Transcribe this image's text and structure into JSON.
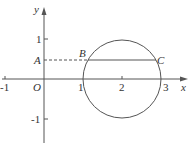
{
  "labels": {
    "y_axis": "y",
    "x_axis": "x",
    "origin": "O",
    "point_a": "A",
    "point_b": "B",
    "point_c": "C",
    "x_ticks": [
      "-1",
      "1",
      "2",
      "3"
    ],
    "y_ticks": [
      "1",
      "-1"
    ]
  },
  "geometry": {
    "circle_center": [
      2,
      0
    ],
    "circle_radius": 1,
    "chord_y": 0.5,
    "line_color": "#555555"
  }
}
